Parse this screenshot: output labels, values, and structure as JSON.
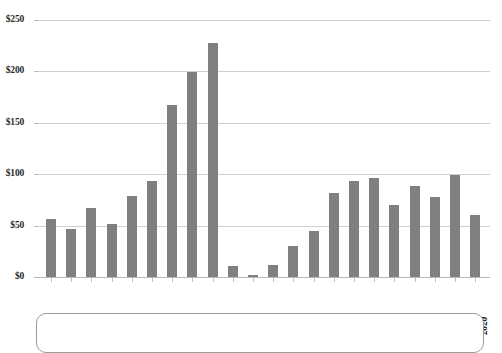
{
  "chart_data": {
    "type": "bar",
    "title": "",
    "xlabel": "",
    "ylabel": "",
    "ylim": [
      0,
      250
    ],
    "grid": true,
    "legend": "none",
    "y_tick_labels": [
      "$250",
      "$200",
      "$150",
      "$100",
      "$50",
      "$0"
    ],
    "y_tick_values": [
      250,
      200,
      150,
      100,
      50,
      0
    ],
    "categories": [
      "1999",
      "2000",
      "2001",
      "2002",
      "2003",
      "2004",
      "2005",
      "2006",
      "2007",
      "2008",
      "2009",
      "2010",
      "2011",
      "2012",
      "2013",
      "2014",
      "2015",
      "2016",
      "2017",
      "2018",
      "2019",
      "2020"
    ],
    "values": [
      56,
      47,
      67,
      52,
      79,
      93,
      167,
      199,
      228,
      11,
      2,
      12,
      30,
      45,
      82,
      93,
      96,
      70,
      89,
      78,
      99,
      60
    ],
    "series": [
      {
        "name": "",
        "values": [
          56,
          47,
          67,
          52,
          79,
          93,
          167,
          199,
          228,
          11,
          2,
          12,
          30,
          45,
          82,
          93,
          96,
          70,
          89,
          78,
          99,
          60
        ]
      }
    ],
    "bar_color": "#808080",
    "gridline_color": "#d0d0d0"
  },
  "caption": {
    "text": ""
  }
}
